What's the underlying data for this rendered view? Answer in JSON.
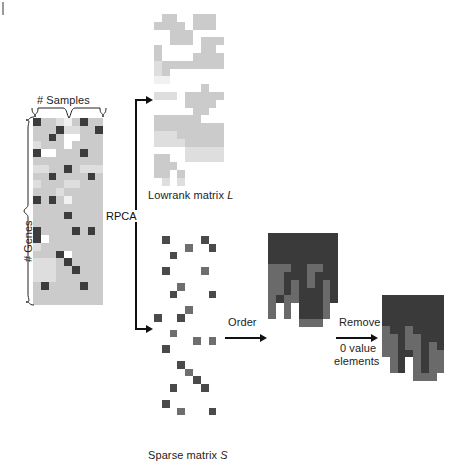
{
  "figure": {
    "domain": "diagram",
    "background": "#ffffff"
  },
  "labels": {
    "samples": "# Samples",
    "genes": "# Genes",
    "rpca": "RPCA",
    "lowrank": "Lowrank matrix ",
    "lowrank_symbol": "L",
    "sparse": "Sparse matrix ",
    "sparse_symbol": "S",
    "order": "Order",
    "remove_line1": "Remove",
    "remove_line2": "0 value",
    "remove_line3": "elements"
  },
  "palette": {
    "white": "#ffffff",
    "very_light": "#f1f1f1",
    "light": "#dedede",
    "mid_light": "#cbcbcb",
    "mid": "#b4b4b4",
    "dark_cell": "#3c3c3c",
    "sparse_dark": "#4a4a4a",
    "sparse_mid": "#6e6e6e",
    "ordered_dark": "#3a3a3a",
    "ordered_mid": "#6a6a6a",
    "grid_line": "#ededed",
    "ink": "#111111"
  },
  "matrices": {
    "original": {
      "name": "input-matrix",
      "cols": 9,
      "rows": 24,
      "cell": 7.8,
      "x": 33,
      "y": 118,
      "legend": {
        "0": "white",
        "1": "very_light",
        "2": "light",
        "3": "mid_light",
        "4": "mid",
        "9": "dark_cell"
      },
      "grid": [
        [
          9,
          3,
          3,
          2,
          1,
          3,
          9,
          3,
          3
        ],
        [
          3,
          3,
          3,
          9,
          2,
          2,
          3,
          3,
          9
        ],
        [
          3,
          3,
          9,
          3,
          0,
          0,
          3,
          3,
          3
        ],
        [
          2,
          3,
          3,
          3,
          0,
          3,
          3,
          3,
          3
        ],
        [
          9,
          0,
          0,
          3,
          3,
          3,
          9,
          3,
          3
        ],
        [
          3,
          3,
          3,
          3,
          3,
          3,
          3,
          3,
          3
        ],
        [
          2,
          2,
          3,
          3,
          9,
          3,
          2,
          2,
          2
        ],
        [
          3,
          3,
          9,
          3,
          3,
          3,
          3,
          9,
          3
        ],
        [
          2,
          3,
          3,
          3,
          2,
          2,
          3,
          3,
          3
        ],
        [
          3,
          3,
          3,
          2,
          3,
          3,
          3,
          3,
          3
        ],
        [
          9,
          3,
          9,
          3,
          1,
          3,
          3,
          3,
          3
        ],
        [
          3,
          3,
          3,
          3,
          3,
          3,
          3,
          3,
          3
        ],
        [
          3,
          3,
          3,
          3,
          9,
          3,
          3,
          3,
          3
        ],
        [
          3,
          3,
          3,
          3,
          3,
          3,
          3,
          3,
          3
        ],
        [
          9,
          3,
          3,
          3,
          3,
          9,
          3,
          9,
          3
        ],
        [
          9,
          0,
          3,
          3,
          3,
          3,
          3,
          3,
          3
        ],
        [
          2,
          3,
          3,
          3,
          3,
          3,
          3,
          3,
          3
        ],
        [
          3,
          3,
          3,
          9,
          0,
          3,
          3,
          3,
          3
        ],
        [
          2,
          2,
          2,
          3,
          9,
          3,
          3,
          3,
          3
        ],
        [
          2,
          2,
          2,
          3,
          3,
          9,
          3,
          3,
          3
        ],
        [
          2,
          2,
          2,
          3,
          3,
          3,
          3,
          3,
          3
        ],
        [
          3,
          9,
          3,
          3,
          3,
          3,
          9,
          3,
          3
        ],
        [
          3,
          3,
          3,
          3,
          3,
          3,
          3,
          3,
          3
        ],
        [
          3,
          3,
          3,
          3,
          3,
          3,
          3,
          3,
          3
        ]
      ]
    },
    "lowrank": {
      "name": "lowrank-matrix",
      "cols": 9,
      "rows": 22,
      "cell": 7.8,
      "x": 154,
      "y": 14,
      "legend": {
        "0": "white",
        "1": "very_light",
        "2": "light",
        "3": "mid_light"
      },
      "grid": [
        [
          0,
          3,
          3,
          0,
          0,
          3,
          3,
          3,
          0
        ],
        [
          3,
          3,
          3,
          3,
          0,
          3,
          3,
          3,
          0
        ],
        [
          0,
          0,
          3,
          3,
          3,
          0,
          0,
          0,
          0
        ],
        [
          0,
          0,
          3,
          3,
          3,
          0,
          3,
          3,
          3
        ],
        [
          3,
          0,
          0,
          0,
          0,
          0,
          3,
          3,
          0
        ],
        [
          3,
          0,
          0,
          0,
          0,
          3,
          3,
          3,
          3
        ],
        [
          2,
          3,
          3,
          3,
          3,
          3,
          3,
          3,
          3
        ],
        [
          2,
          3,
          0,
          0,
          0,
          0,
          0,
          0,
          0
        ],
        [
          1,
          1,
          0,
          0,
          0,
          0,
          0,
          0,
          0
        ],
        [
          0,
          0,
          0,
          0,
          0,
          0,
          3,
          0,
          0
        ],
        [
          2,
          2,
          2,
          0,
          3,
          3,
          3,
          3,
          3
        ],
        [
          0,
          0,
          0,
          0,
          3,
          3,
          3,
          3,
          0
        ],
        [
          0,
          0,
          0,
          0,
          0,
          3,
          3,
          0,
          0
        ],
        [
          3,
          3,
          3,
          3,
          3,
          3,
          0,
          0,
          0
        ],
        [
          3,
          3,
          3,
          3,
          3,
          3,
          3,
          3,
          3
        ],
        [
          2,
          2,
          2,
          3,
          3,
          3,
          3,
          3,
          3
        ],
        [
          2,
          2,
          2,
          2,
          3,
          3,
          3,
          3,
          3
        ],
        [
          0,
          0,
          0,
          0,
          2,
          2,
          2,
          2,
          2
        ],
        [
          3,
          3,
          0,
          0,
          2,
          2,
          2,
          2,
          2
        ],
        [
          3,
          3,
          3,
          0,
          0,
          0,
          0,
          0,
          0
        ],
        [
          3,
          3,
          0,
          3,
          0,
          0,
          0,
          0,
          0
        ],
        [
          0,
          2,
          0,
          2,
          0,
          0,
          0,
          0,
          0
        ]
      ]
    },
    "sparse": {
      "name": "sparse-matrix",
      "cols": 9,
      "rows": 24,
      "cell": 7.8,
      "x": 154,
      "y": 236,
      "legend": {
        "0": "white",
        "5": "sparse_mid",
        "9": "sparse_dark"
      },
      "grid": [
        [
          0,
          9,
          0,
          0,
          0,
          0,
          9,
          0,
          0
        ],
        [
          0,
          0,
          0,
          0,
          5,
          0,
          0,
          9,
          0
        ],
        [
          0,
          0,
          9,
          0,
          0,
          0,
          0,
          0,
          0
        ],
        [
          0,
          0,
          0,
          0,
          0,
          0,
          0,
          0,
          0
        ],
        [
          0,
          9,
          0,
          0,
          0,
          0,
          5,
          0,
          0
        ],
        [
          0,
          0,
          0,
          0,
          0,
          0,
          0,
          0,
          0
        ],
        [
          0,
          0,
          0,
          5,
          0,
          0,
          0,
          0,
          0
        ],
        [
          0,
          0,
          9,
          0,
          0,
          0,
          0,
          9,
          0
        ],
        [
          0,
          0,
          0,
          0,
          0,
          0,
          0,
          0,
          0
        ],
        [
          0,
          0,
          0,
          0,
          5,
          0,
          0,
          0,
          0
        ],
        [
          9,
          0,
          0,
          9,
          0,
          0,
          0,
          0,
          0
        ],
        [
          0,
          0,
          0,
          0,
          0,
          0,
          0,
          0,
          0
        ],
        [
          0,
          0,
          5,
          0,
          0,
          0,
          0,
          0,
          0
        ],
        [
          0,
          0,
          0,
          0,
          0,
          5,
          0,
          5,
          0
        ],
        [
          0,
          9,
          0,
          0,
          0,
          0,
          0,
          0,
          0
        ],
        [
          0,
          0,
          0,
          0,
          0,
          0,
          0,
          0,
          0
        ],
        [
          0,
          0,
          0,
          9,
          0,
          0,
          0,
          0,
          0
        ],
        [
          0,
          0,
          0,
          0,
          5,
          0,
          0,
          0,
          0
        ],
        [
          0,
          0,
          0,
          0,
          0,
          9,
          0,
          0,
          0
        ],
        [
          0,
          0,
          9,
          0,
          0,
          0,
          9,
          0,
          0
        ],
        [
          0,
          0,
          0,
          0,
          0,
          0,
          0,
          0,
          0
        ],
        [
          0,
          9,
          0,
          0,
          0,
          0,
          0,
          0,
          0
        ],
        [
          0,
          0,
          0,
          5,
          0,
          0,
          0,
          9,
          0
        ],
        [
          0,
          0,
          0,
          0,
          0,
          0,
          0,
          0,
          0
        ]
      ]
    },
    "ordered": {
      "name": "ordered-matrix",
      "cols": 9,
      "rows": 12,
      "cell": 7.8,
      "x": 268,
      "y": 233,
      "legend": {
        "0": "white",
        "5": "ordered_mid",
        "9": "ordered_dark"
      },
      "grid": [
        [
          9,
          9,
          9,
          9,
          9,
          9,
          9,
          9,
          9
        ],
        [
          9,
          9,
          9,
          9,
          9,
          9,
          9,
          9,
          9
        ],
        [
          9,
          9,
          9,
          9,
          9,
          9,
          9,
          9,
          9
        ],
        [
          9,
          9,
          9,
          9,
          9,
          9,
          9,
          9,
          9
        ],
        [
          5,
          5,
          5,
          9,
          9,
          5,
          5,
          9,
          9
        ],
        [
          5,
          5,
          9,
          9,
          9,
          5,
          9,
          9,
          9
        ],
        [
          5,
          5,
          9,
          5,
          9,
          5,
          9,
          5,
          9
        ],
        [
          5,
          5,
          9,
          5,
          9,
          9,
          9,
          5,
          9
        ],
        [
          5,
          9,
          5,
          5,
          9,
          9,
          9,
          5,
          9
        ],
        [
          5,
          0,
          5,
          0,
          9,
          9,
          9,
          5,
          0
        ],
        [
          5,
          0,
          5,
          0,
          9,
          9,
          9,
          5,
          0
        ],
        [
          0,
          0,
          0,
          0,
          5,
          5,
          5,
          0,
          0
        ]
      ]
    },
    "final": {
      "name": "final-matrix",
      "cols": 8,
      "rows": 11,
      "cell": 7.8,
      "x": 382,
      "y": 295,
      "legend": {
        "0": "white",
        "5": "ordered_mid",
        "9": "ordered_dark"
      },
      "grid": [
        [
          9,
          9,
          9,
          9,
          9,
          9,
          9,
          9
        ],
        [
          9,
          9,
          9,
          9,
          9,
          9,
          9,
          9
        ],
        [
          9,
          9,
          9,
          9,
          9,
          9,
          9,
          9
        ],
        [
          9,
          9,
          9,
          9,
          9,
          9,
          9,
          9
        ],
        [
          5,
          9,
          9,
          5,
          9,
          9,
          9,
          9
        ],
        [
          5,
          5,
          9,
          5,
          5,
          9,
          9,
          9
        ],
        [
          5,
          5,
          9,
          5,
          5,
          9,
          5,
          9
        ],
        [
          5,
          5,
          9,
          9,
          5,
          9,
          5,
          5
        ],
        [
          0,
          5,
          9,
          0,
          5,
          9,
          5,
          5
        ],
        [
          0,
          5,
          9,
          0,
          5,
          9,
          5,
          5
        ],
        [
          0,
          0,
          0,
          0,
          5,
          5,
          5,
          0
        ]
      ]
    }
  },
  "connectors": {
    "rpca_label": "RPCA",
    "order_label": "Order",
    "remove_label": "Remove 0 value elements"
  }
}
